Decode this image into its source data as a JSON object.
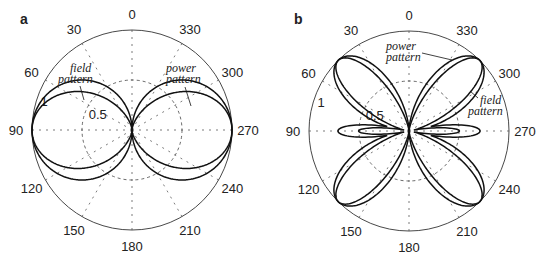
{
  "chart_data": [
    {
      "type": "polar-line",
      "panel_label": "a",
      "angle_ticks": [
        "0",
        "30",
        "60",
        "90",
        "120",
        "150",
        "180",
        "210",
        "240",
        "270",
        "300",
        "330"
      ],
      "angle_tick_degrees": [
        0,
        30,
        60,
        90,
        120,
        150,
        180,
        210,
        240,
        270,
        300,
        330
      ],
      "angle_direction": "counterclockwise from top",
      "radial_ticks": [
        "0.5",
        "1"
      ],
      "radial_tick_values": [
        0.5,
        1
      ],
      "rlim": [
        0,
        1
      ],
      "grid": true,
      "series": [
        {
          "name": "field pattern",
          "model": "abs_sin",
          "peak": 1,
          "samples": {
            "angles": [
              0,
              30,
              60,
              90,
              120,
              150,
              180
            ],
            "values": [
              0,
              0.5,
              0.87,
              1,
              0.87,
              0.5,
              0
            ]
          }
        },
        {
          "name": "power pattern",
          "model": "sin_squared",
          "peak": 1,
          "samples": {
            "angles": [
              0,
              30,
              60,
              90,
              120,
              150,
              180
            ],
            "values": [
              0,
              0.25,
              0.75,
              1,
              0.75,
              0.25,
              0
            ]
          }
        }
      ],
      "annotations": [
        {
          "text_line1": "field",
          "text_line2": "pattern"
        },
        {
          "text_line1": "power",
          "text_line2": "pattern"
        }
      ]
    },
    {
      "type": "polar-line",
      "panel_label": "b",
      "angle_ticks": [
        "0",
        "30",
        "60",
        "90",
        "120",
        "150",
        "180",
        "210",
        "240",
        "270",
        "300",
        "330"
      ],
      "angle_tick_degrees": [
        0,
        30,
        60,
        90,
        120,
        150,
        180,
        210,
        240,
        270,
        300,
        330
      ],
      "angle_direction": "counterclockwise from top",
      "radial_ticks": [
        "0.5",
        "1"
      ],
      "radial_tick_values": [
        0.5,
        1
      ],
      "rlim": [
        0,
        1
      ],
      "grid": true,
      "series": [
        {
          "name": "field pattern",
          "main_lobe_angles": [
            45,
            135,
            225,
            315
          ],
          "main_lobe_peak": 1,
          "side_lobe_angles": [
            90,
            270
          ],
          "side_lobe_peak": 0.71,
          "samples": {
            "angles": [
              0,
              15,
              30,
              45,
              60,
              75,
              90
            ],
            "values": [
              0,
              0.55,
              0.92,
              1,
              0.7,
              0,
              0.71
            ]
          }
        },
        {
          "name": "power pattern",
          "main_lobe_angles": [
            45,
            135,
            225,
            315
          ],
          "main_lobe_peak": 1,
          "side_lobe_angles": [
            90,
            270
          ],
          "side_lobe_peak": 0.5,
          "samples": {
            "angles": [
              0,
              15,
              30,
              45,
              60,
              75,
              90
            ],
            "values": [
              0,
              0.3,
              0.85,
              1,
              0.49,
              0,
              0.5
            ]
          }
        }
      ],
      "annotations": [
        {
          "text_line1": "power",
          "text_line2": "pattern"
        },
        {
          "text_line1": "field",
          "text_line2": "pattern"
        }
      ]
    }
  ]
}
